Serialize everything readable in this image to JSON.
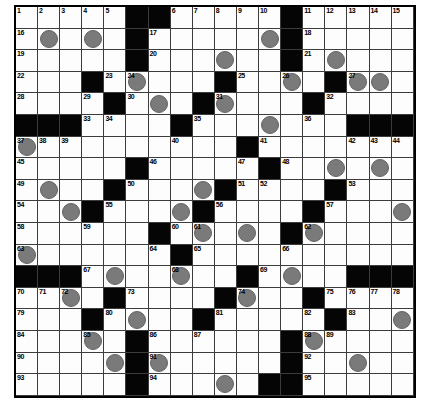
{
  "puzzle": {
    "kind": "crossword-grid",
    "rows": 18,
    "cols": 18,
    "legend": {
      "black": "#",
      "circled_white": "O",
      "white": "."
    },
    "cells": [
      ".....##.....#.....",
      ".O.O.#.....O#.....",
      ".....#...O..#.O...",
      "...#.O...#..O.#OO.",
      "....#.O.#O...#....",
      "###....#...O...###",
      "O.........#.......",
      ".....#.....#..O.O.",
      ".O..#...O#....#...",
      "..O#...O#....#...O",
      "......#.O.O.#O....",
      "O......#..........",
      "###.O..O..#.O..###",
      "..O.#....#O..#....",
      "...#.O..#.....#..O",
      "...O.#......#O....",
      "....O#O.....#..O..",
      ".....#...O.##....."
    ],
    "numbers": [
      [
        1,
        1,
        1
      ],
      [
        2,
        1,
        2
      ],
      [
        3,
        1,
        3
      ],
      [
        4,
        1,
        4
      ],
      [
        5,
        1,
        5
      ],
      [
        6,
        1,
        8
      ],
      [
        7,
        1,
        9
      ],
      [
        8,
        1,
        10
      ],
      [
        9,
        1,
        11
      ],
      [
        10,
        1,
        12
      ],
      [
        11,
        1,
        14
      ],
      [
        12,
        1,
        15
      ],
      [
        13,
        1,
        16
      ],
      [
        14,
        1,
        17
      ],
      [
        15,
        1,
        18
      ],
      [
        16,
        2,
        1
      ],
      [
        17,
        2,
        7
      ],
      [
        18,
        2,
        14
      ],
      [
        19,
        3,
        1
      ],
      [
        20,
        3,
        7
      ],
      [
        21,
        3,
        14
      ],
      [
        22,
        4,
        1
      ],
      [
        23,
        4,
        5
      ],
      [
        24,
        4,
        6
      ],
      [
        25,
        4,
        11
      ],
      [
        26,
        4,
        13
      ],
      [
        27,
        4,
        16
      ],
      [
        28,
        5,
        1
      ],
      [
        29,
        5,
        4
      ],
      [
        30,
        5,
        6
      ],
      [
        31,
        5,
        10
      ],
      [
        32,
        5,
        15
      ],
      [
        33,
        6,
        4
      ],
      [
        34,
        6,
        5
      ],
      [
        35,
        6,
        9
      ],
      [
        36,
        6,
        14
      ],
      [
        37,
        7,
        1
      ],
      [
        38,
        7,
        2
      ],
      [
        39,
        7,
        3
      ],
      [
        40,
        7,
        8
      ],
      [
        41,
        7,
        12
      ],
      [
        42,
        7,
        16
      ],
      [
        43,
        7,
        17
      ],
      [
        44,
        7,
        18
      ],
      [
        45,
        8,
        1
      ],
      [
        46,
        8,
        7
      ],
      [
        47,
        8,
        11
      ],
      [
        48,
        8,
        13
      ],
      [
        49,
        9,
        1
      ],
      [
        50,
        9,
        6
      ],
      [
        51,
        9,
        11
      ],
      [
        52,
        9,
        12
      ],
      [
        53,
        9,
        16
      ],
      [
        54,
        10,
        1
      ],
      [
        55,
        10,
        5
      ],
      [
        56,
        10,
        10
      ],
      [
        57,
        10,
        15
      ],
      [
        58,
        11,
        1
      ],
      [
        59,
        11,
        4
      ],
      [
        60,
        11,
        8
      ],
      [
        61,
        11,
        9
      ],
      [
        62,
        11,
        14
      ],
      [
        63,
        12,
        1
      ],
      [
        64,
        12,
        7
      ],
      [
        65,
        12,
        9
      ],
      [
        66,
        12,
        13
      ],
      [
        67,
        13,
        4
      ],
      [
        68,
        13,
        8
      ],
      [
        69,
        13,
        12
      ],
      [
        70,
        14,
        1
      ],
      [
        71,
        14,
        2
      ],
      [
        72,
        14,
        3
      ],
      [
        73,
        14,
        6
      ],
      [
        74,
        14,
        11
      ],
      [
        75,
        14,
        15
      ],
      [
        76,
        14,
        16
      ],
      [
        77,
        14,
        17
      ],
      [
        78,
        14,
        18
      ],
      [
        79,
        15,
        1
      ],
      [
        80,
        15,
        5
      ],
      [
        81,
        15,
        10
      ],
      [
        82,
        15,
        14
      ],
      [
        83,
        15,
        16
      ],
      [
        84,
        16,
        1
      ],
      [
        85,
        16,
        4
      ],
      [
        86,
        16,
        7
      ],
      [
        87,
        16,
        9
      ],
      [
        88,
        16,
        14
      ],
      [
        89,
        16,
        15
      ],
      [
        90,
        17,
        1
      ],
      [
        91,
        17,
        7
      ],
      [
        92,
        17,
        14
      ],
      [
        93,
        18,
        1
      ],
      [
        94,
        18,
        7
      ],
      [
        95,
        18,
        14
      ]
    ],
    "colors": {
      "page_background": "#ffffff",
      "cell_background": "#fdfdfd",
      "black_cell": "#050505",
      "grid_line": "#3c3c3c",
      "outer_border": "#000000",
      "circle_fill": "#7a7a7a",
      "circle_edge": "#636363",
      "number_text": "#000000"
    }
  }
}
